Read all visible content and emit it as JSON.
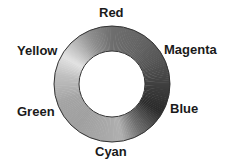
{
  "diagram": {
    "type": "color-wheel-ring",
    "labels": {
      "top": "Red",
      "upper_right": "Magenta",
      "lower_right": "Blue",
      "bottom": "Cyan",
      "lower_left": "Green",
      "upper_left": "Yellow"
    },
    "ring": {
      "center": [
        112,
        84
      ],
      "outer_radius": 58,
      "inner_radius": 33,
      "shades": {
        "Red": "#6a6a6a",
        "Magenta": "#555555",
        "Blue": "#2e2e2e",
        "Cyan": "#a0a0a0",
        "Green": "#9a9a9a",
        "Yellow": "#d8d8d8"
      }
    }
  }
}
